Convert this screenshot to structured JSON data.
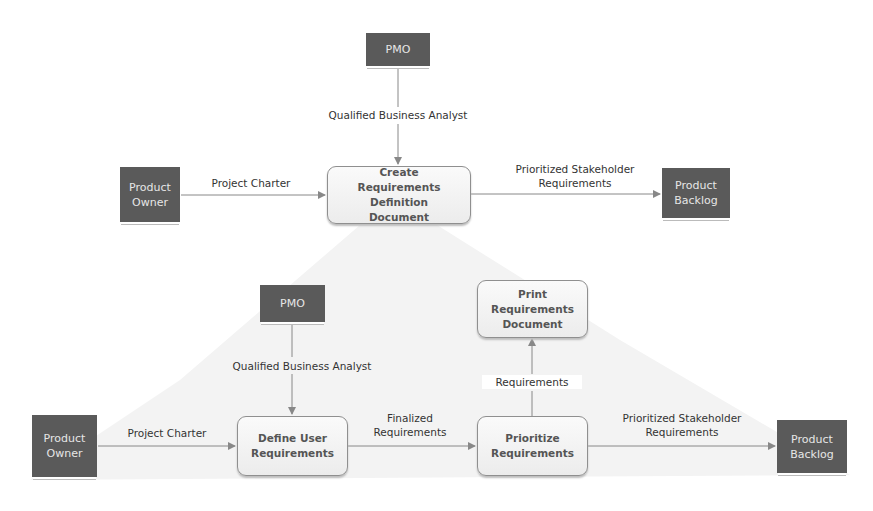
{
  "top_diagram": {
    "pmo": "PMO",
    "product_owner": "Product Owner",
    "process": "Create Requirements Definition Document",
    "product_backlog": "Product Backlog",
    "edges": {
      "pmo_to_process": "Qualified Business Analyst",
      "owner_to_process": "Project Charter",
      "process_to_backlog": "Prioritized Stakeholder Requirements"
    }
  },
  "bottom_diagram": {
    "pmo": "PMO",
    "product_owner": "Product Owner",
    "define": "Define User Requirements",
    "prioritize": "Prioritize Requirements",
    "print": "Print Requirements Document",
    "product_backlog": "Product Backlog",
    "edges": {
      "pmo_to_define": "Qualified Business Analyst",
      "owner_to_define": "Project Charter",
      "define_to_prioritize": "Finalized Requirements",
      "prioritize_to_print": "Requirements",
      "prioritize_to_backlog": "Prioritized Stakeholder Requirements"
    }
  },
  "colors": {
    "external_entity": "#5a5a5a",
    "process_border": "#8f8f8f",
    "arrow": "#888888",
    "decomposition_shade": "#f2f2f2"
  }
}
